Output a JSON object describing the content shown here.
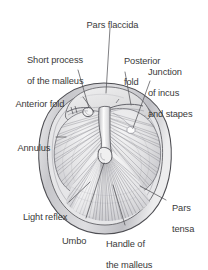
{
  "figure": {
    "background_color": "#ffffff",
    "text_color": "#3a3a3a",
    "line_color": "#55555a",
    "membrane_fill": "#e9e9ea",
    "annulus_fill": "#cfcfd2",
    "pars_flaccida_fill": "#e3e3e4",
    "light_reflex_fill": "#fbfbfb",
    "malleus_fill": "#ededee"
  },
  "labels": [
    {
      "id": "pars-flaccida",
      "text": "Pars flaccida",
      "lines": [
        "Pars flaccida"
      ]
    },
    {
      "id": "short-process-malleus",
      "text": "Short process of the malleus",
      "lines": [
        "Short process",
        "of the malleus"
      ]
    },
    {
      "id": "posterior-fold",
      "text": "Posterior fold",
      "lines": [
        "Posterior",
        "fold"
      ]
    },
    {
      "id": "junction-incus-stapes",
      "text": "Junction of incus and stapes",
      "lines": [
        "Junction",
        "of incus",
        "and stapes"
      ]
    },
    {
      "id": "anterior-fold",
      "text": "Anterior fold",
      "lines": [
        "Anterior fold"
      ]
    },
    {
      "id": "annulus",
      "text": "Annulus",
      "lines": [
        "Annulus"
      ]
    },
    {
      "id": "light-reflex",
      "text": "Light reflex",
      "lines": [
        "Light reflex"
      ]
    },
    {
      "id": "umbo",
      "text": "Umbo",
      "lines": [
        "Umbo"
      ]
    },
    {
      "id": "handle-of-malleus",
      "text": "Handle of the malleus",
      "lines": [
        "Handle of",
        "the malleus"
      ]
    },
    {
      "id": "pars-tensa",
      "text": "Pars tensa",
      "lines": [
        "Pars",
        "tensa"
      ]
    }
  ],
  "text": {
    "pars_flaccida": "Pars flaccida",
    "short_process_l1": "Short process",
    "short_process_l2": "of the malleus",
    "posterior_fold_l1": "Posterior",
    "posterior_fold_l2": "fold",
    "junction_l1": "Junction",
    "junction_l2": "of incus",
    "junction_l3": "and stapes",
    "anterior_fold": "Anterior fold",
    "annulus": "Annulus",
    "light_reflex": "Light reflex",
    "umbo": "Umbo",
    "handle_l1": "Handle of",
    "handle_l2": "the malleus",
    "pars_tensa_l1": "Pars",
    "pars_tensa_l2": "tensa"
  }
}
